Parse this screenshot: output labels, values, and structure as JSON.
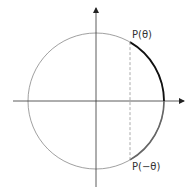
{
  "diagram": {
    "type": "unit-circle",
    "labels": {
      "p_theta": "P(θ)",
      "p_neg_theta": "P(−θ)"
    },
    "colors": {
      "circle": "#888888",
      "axes": "#333333",
      "arc_positive": "#111111",
      "arc_negative": "#666666",
      "dashed": "#888888"
    }
  }
}
